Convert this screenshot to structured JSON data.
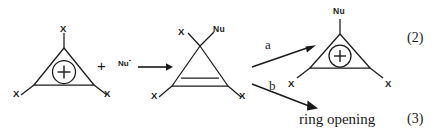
{
  "scheme": {
    "title": "Nucleophilic attack on trihalocyclopropenyl cation",
    "ink_color": "#1a1a1a",
    "background": "#ffffff"
  },
  "reactant": {
    "name": "trisubstituted cyclopropenyl cation",
    "charge_symbol": "+",
    "substituent_top": "X",
    "substituent_bottom_left": "X",
    "substituent_bottom_right": "X"
  },
  "operator": {
    "plus": "+"
  },
  "reagent": {
    "label": "Nu",
    "charge": "-"
  },
  "intermediate": {
    "name": "cyclopropene adduct",
    "apex_left": "X",
    "apex_right": "Nu",
    "substituent_bottom_left": "X",
    "substituent_bottom_right": "X"
  },
  "branches": [
    {
      "key": "a",
      "label": "a",
      "direction": "up-right",
      "outcome": "cation product"
    },
    {
      "key": "b",
      "label": "b",
      "direction": "down-right",
      "outcome": "ring opening"
    }
  ],
  "product_cation": {
    "name": "Nu-substituted cyclopropenyl cation",
    "charge_symbol": "+",
    "substituent_top": "Nu",
    "substituent_bottom_left": "X",
    "substituent_bottom_right": "X"
  },
  "product_text": {
    "label": "ring opening"
  },
  "equation_numbers": {
    "upper": "(2)",
    "lower": "(3)"
  }
}
